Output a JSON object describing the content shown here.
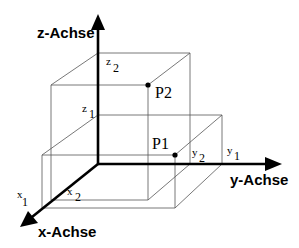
{
  "diagram": {
    "axes": {
      "x": {
        "label": "x-Achse"
      },
      "y": {
        "label": "y-Achse"
      },
      "z": {
        "label": "z-Achse"
      }
    },
    "points": [
      {
        "name": "P1",
        "label": "P1",
        "coords": [
          "x1",
          "y2",
          "z1"
        ]
      },
      {
        "name": "P2",
        "label": "P2",
        "coords": [
          "x2",
          "y1",
          "z2"
        ]
      }
    ],
    "ticks": {
      "x1": {
        "base": "x",
        "sub": "1"
      },
      "x2": {
        "base": "x",
        "sub": "2"
      },
      "y1": {
        "base": "y",
        "sub": "1"
      },
      "y2": {
        "base": "y",
        "sub": "2"
      },
      "z1": {
        "base": "z",
        "sub": "1"
      },
      "z2": {
        "base": "z",
        "sub": "2"
      }
    },
    "colors": {
      "axis": "#000000",
      "guide_lines": "#555555",
      "background": "#ffffff"
    }
  }
}
